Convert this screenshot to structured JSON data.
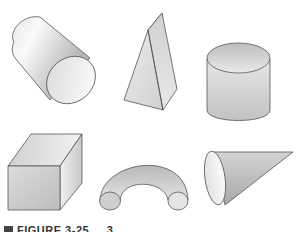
{
  "figure": {
    "shapes": [
      {
        "name": "cylinder-tilted",
        "label": "Cylinder (tilted)"
      },
      {
        "name": "pyramid",
        "label": "Triangular pyramid"
      },
      {
        "name": "cylinder-upright",
        "label": "Cylinder (upright)"
      },
      {
        "name": "cube",
        "label": "Cube"
      },
      {
        "name": "half-torus",
        "label": "Half torus"
      },
      {
        "name": "cone",
        "label": "Cone"
      }
    ],
    "caption": "FIGURE 3-25",
    "caption_suffix": "3",
    "colors": {
      "outline": "#555555",
      "shade_dark": "#bdbdbd",
      "shade_light": "#f4f4f4",
      "background": "#ffffff"
    }
  }
}
